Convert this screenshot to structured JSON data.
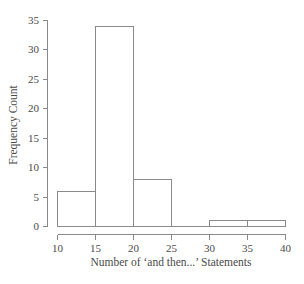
{
  "figure": {
    "background": "#ffffff"
  },
  "chart_data": {
    "type": "bar",
    "subtype": "histogram",
    "title": "",
    "xlabel": "Number of ‘and then...’ Statements",
    "ylabel": "Frequency Count",
    "xlim": [
      10,
      40
    ],
    "ylim": [
      0,
      35
    ],
    "x_ticks": [
      10,
      15,
      20,
      25,
      30,
      35,
      40
    ],
    "y_ticks": [
      0,
      5,
      10,
      15,
      20,
      25,
      30,
      35
    ],
    "bins": [
      {
        "start": 10,
        "end": 15,
        "count": 6
      },
      {
        "start": 15,
        "end": 20,
        "count": 34
      },
      {
        "start": 20,
        "end": 25,
        "count": 8
      },
      {
        "start": 25,
        "end": 30,
        "count": 0
      },
      {
        "start": 30,
        "end": 35,
        "count": 1
      },
      {
        "start": 35,
        "end": 40,
        "count": 1
      }
    ],
    "grid": false,
    "legend": false,
    "colors": {
      "line": "#8a8a8a",
      "bar_fill": "#ffffff",
      "text": "#4a4a4a",
      "background": "#ffffff"
    }
  }
}
